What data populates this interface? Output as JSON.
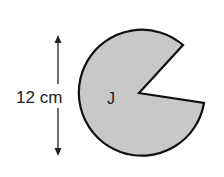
{
  "diagram": {
    "shape_label": "J",
    "dimension_label": "12 cm",
    "colors": {
      "fill": "#c8c8c8",
      "stroke": "#111111",
      "text": "#222222",
      "background": "#ffffff"
    },
    "shape": {
      "type": "sector (circle with wedge removed)",
      "center": [
        139,
        93
      ],
      "radius": 63,
      "arc_start": [
        183,
        45
      ],
      "arc_end": [
        204,
        103
      ]
    },
    "dimension_arrow": {
      "x": 58,
      "y_top": 36,
      "y_bottom": 155,
      "represents": "diameter"
    }
  }
}
